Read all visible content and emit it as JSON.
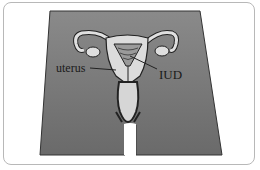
{
  "diagram": {
    "labels": {
      "uterus": "uterus",
      "iud": "IUD"
    },
    "colors": {
      "body": "#6f6f6f",
      "organ": "#d9d9d9",
      "outline": "#222222",
      "border": "#b8b8b8"
    }
  }
}
